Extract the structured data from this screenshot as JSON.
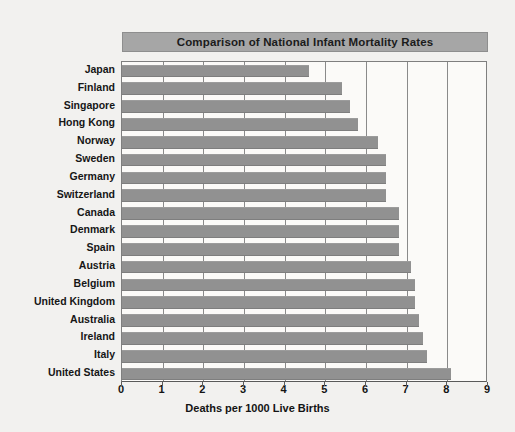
{
  "chart_data": {
    "type": "bar",
    "orientation": "horizontal",
    "title": "Comparison of National Infant Mortality Rates",
    "xlabel": "Deaths per 1000 Live Births",
    "ylabel": "",
    "xlim": [
      0,
      9
    ],
    "xticks": [
      0,
      1,
      2,
      3,
      4,
      5,
      6,
      7,
      8,
      9
    ],
    "xtick_labels": [
      "0",
      "1",
      "2",
      "3",
      "4",
      "5",
      "6",
      "7",
      "8",
      "9"
    ],
    "grid": "vertical",
    "legend": "none",
    "bar_color": "#919191",
    "title_background": "#a6a6a6",
    "plot_background": "#fbfaf8",
    "categories": [
      "Japan",
      "Finland",
      "Singapore",
      "Hong Kong",
      "Norway",
      "Sweden",
      "Germany",
      "Switzerland",
      "Canada",
      "Denmark",
      "Spain",
      "Austria",
      "Belgium",
      "United Kingdom",
      "Australia",
      "Ireland",
      "Italy",
      "United States"
    ],
    "values": [
      4.6,
      5.4,
      5.6,
      5.8,
      6.3,
      6.5,
      6.5,
      6.5,
      6.8,
      6.8,
      6.8,
      7.1,
      7.2,
      7.2,
      7.3,
      7.4,
      7.5,
      8.1
    ]
  }
}
